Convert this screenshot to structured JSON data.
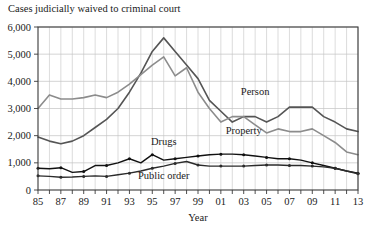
{
  "chart_data": {
    "type": "line",
    "title": "Cases judicially waived to criminal court",
    "xlabel": "Year",
    "ylabel": "",
    "xlim": [
      1985,
      2013
    ],
    "ylim": [
      0,
      6000
    ],
    "grid": true,
    "legend_position": "inline-annotations",
    "ytick_labels": [
      "0",
      "1,000",
      "2,000",
      "3,000",
      "4,000",
      "5,000",
      "6,000"
    ],
    "ytick_values": [
      0,
      1000,
      2000,
      3000,
      4000,
      5000,
      6000
    ],
    "xtick_labels": [
      "85",
      "87",
      "89",
      "91",
      "93",
      "95",
      "97",
      "99",
      "01",
      "03",
      "05",
      "07",
      "09",
      "11",
      "13"
    ],
    "xtick_values": [
      1985,
      1987,
      1989,
      1991,
      1993,
      1995,
      1997,
      1999,
      2001,
      2003,
      2005,
      2007,
      2009,
      2011,
      2013
    ],
    "x": [
      1985,
      1986,
      1987,
      1988,
      1989,
      1990,
      1991,
      1992,
      1993,
      1994,
      1995,
      1996,
      1997,
      1998,
      1999,
      2000,
      2001,
      2002,
      2003,
      2004,
      2005,
      2006,
      2007,
      2008,
      2009,
      2010,
      2011,
      2012,
      2013
    ],
    "series": [
      {
        "name": "Person",
        "color": "#555555",
        "width": 1.6,
        "markers": false,
        "values": [
          1950,
          1800,
          1700,
          1800,
          2000,
          2300,
          2600,
          3000,
          3600,
          4300,
          5100,
          5600,
          5100,
          4600,
          4100,
          3300,
          2900,
          2500,
          2700,
          2700,
          2500,
          2700,
          3050,
          3050,
          3050,
          2700,
          2500,
          2250,
          2150
        ]
      },
      {
        "name": "Property",
        "color": "#8c8c8c",
        "width": 1.6,
        "markers": false,
        "values": [
          3000,
          3500,
          3350,
          3350,
          3400,
          3500,
          3400,
          3600,
          3900,
          4250,
          4600,
          4900,
          4200,
          4500,
          3600,
          3000,
          2500,
          2700,
          2700,
          2400,
          2100,
          2250,
          2150,
          2150,
          2250,
          2000,
          1750,
          1400,
          1300
        ]
      },
      {
        "name": "Drugs",
        "color": "#111111",
        "width": 1.4,
        "markers": true,
        "values": [
          800,
          780,
          820,
          650,
          680,
          900,
          900,
          1000,
          1150,
          1000,
          1300,
          1100,
          1150,
          1200,
          1250,
          1300,
          1320,
          1320,
          1300,
          1250,
          1200,
          1150,
          1150,
          1100,
          1000,
          900,
          800,
          700,
          620
        ]
      },
      {
        "name": "Public order",
        "color": "#2b2b2b",
        "width": 1.4,
        "markers": true,
        "values": [
          520,
          500,
          470,
          480,
          500,
          520,
          500,
          560,
          620,
          700,
          800,
          880,
          980,
          1050,
          920,
          880,
          880,
          880,
          880,
          900,
          920,
          920,
          900,
          900,
          880,
          850,
          800,
          700,
          600
        ]
      }
    ],
    "annotations": [
      {
        "text": "Person",
        "x": 2004,
        "y": 3500
      },
      {
        "text": "Property",
        "x": 2003,
        "y": 2050
      },
      {
        "text": "Drugs",
        "x": 1996,
        "y": 1650
      },
      {
        "text": "Public order",
        "x": 1996,
        "y": 400
      }
    ]
  }
}
